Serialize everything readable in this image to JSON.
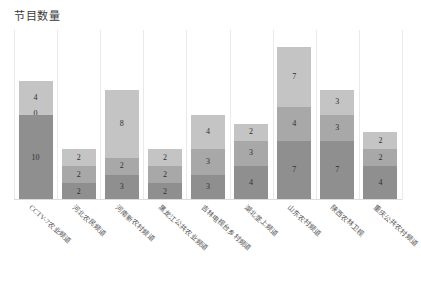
{
  "chart_data": {
    "type": "bar",
    "subtype": "stacked-bar",
    "title": "节目数量",
    "xlabel": "",
    "ylabel": "",
    "ylim": [
      0,
      20
    ],
    "grid": "vertical-only",
    "legend": "none",
    "orientation": "vertical",
    "categories": [
      "CCTV-7农业频道",
      "河北农民频道",
      "河南新农村频道",
      "黑龙江公共农业频道",
      "吉林电视台乡村频道",
      "湖北垄上频道",
      "山东农村频道",
      "陕西农林卫视",
      "重庆公共农村频道"
    ],
    "series": [
      {
        "name": "系列1",
        "color": "#8f8f8f",
        "values": [
          10,
          2,
          3,
          2,
          3,
          4,
          7,
          7,
          4
        ]
      },
      {
        "name": "系列2",
        "color": "#a8a8a8",
        "values": [
          0,
          2,
          2,
          2,
          3,
          3,
          4,
          3,
          2
        ]
      },
      {
        "name": "系列3",
        "color": "#c4c4c4",
        "values": [
          4,
          2,
          8,
          2,
          4,
          2,
          7,
          3,
          2
        ]
      }
    ],
    "totals": [
      14,
      6,
      13,
      6,
      10,
      9,
      18,
      13,
      8
    ],
    "data_labels": [
      {
        "category": "CCTV-7农业频道",
        "bottom": "10",
        "middle": "0",
        "top": "4"
      },
      {
        "category": "河北农民频道",
        "bottom": "2",
        "middle": "2",
        "top": "2"
      },
      {
        "category": "河南新农村频道",
        "bottom": "3",
        "middle": "2",
        "top": "8"
      },
      {
        "category": "黑龙江公共农业频道",
        "bottom": "2",
        "middle": "2",
        "top": "2"
      },
      {
        "category": "吉林电视台乡村频道",
        "bottom": "3",
        "middle": "3",
        "top": "4"
      },
      {
        "category": "湖北垄上频道",
        "bottom": "4",
        "middle": "3",
        "top": "2"
      },
      {
        "category": "山东农村频道",
        "bottom": "7",
        "middle": "4",
        "top": "7"
      },
      {
        "category": "陕西农林卫视",
        "bottom": "7",
        "middle": "3",
        "top": "3"
      },
      {
        "category": "重庆公共农村频道",
        "bottom": "4",
        "middle": "2",
        "top": "2"
      }
    ]
  },
  "colors": {
    "background": "#ffffff",
    "gridline": "#e9e9e9",
    "axis": "#dcdcdc",
    "title_text": "#3a3a3a",
    "label_text": "#555555",
    "value_text": "#2f2f2f"
  }
}
